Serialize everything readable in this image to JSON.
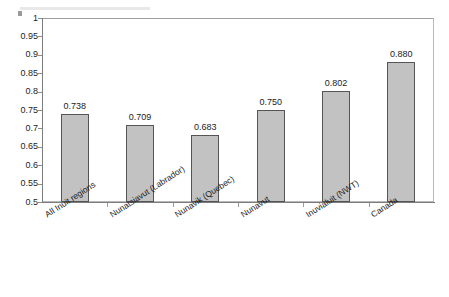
{
  "chart_data": {
    "type": "bar",
    "title": "",
    "subtitle": "",
    "xlabel": "",
    "ylabel": "",
    "categories": [
      "All Inuit regions",
      "Nunatsiavut (Labrador)",
      "Nunavik (Quebec)",
      "Nunavut",
      "Inuvialuit (NWT)",
      "Canada"
    ],
    "values": [
      0.738,
      0.709,
      0.683,
      0.75,
      0.802,
      0.88
    ],
    "data_labels": [
      "0.738",
      "0.709",
      "0.683",
      "0.750",
      "0.802",
      "0.880"
    ],
    "ylim": [
      0.5,
      1
    ],
    "ytick_labels": [
      "1",
      "0.95",
      "0.9",
      "0.85",
      "0.8",
      "0.75",
      "0.7",
      "0.65",
      "0.6",
      "0.55",
      "0.5"
    ],
    "ytick_values": [
      1,
      0.95,
      0.9,
      0.85,
      0.8,
      0.75,
      0.7,
      0.65,
      0.6,
      0.55,
      0.5
    ],
    "ytick_step": 0.05,
    "grid": false,
    "legend": false,
    "legend_position": "none",
    "bar_color": "#c2c2c2",
    "bar_border_color": "#555555",
    "axis_color": "#7c7c7c",
    "plot_background": "#ffffff",
    "label_rotation_deg": -33
  }
}
